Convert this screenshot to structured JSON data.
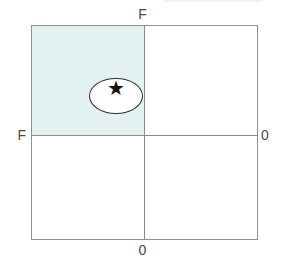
{
  "figure": {
    "axis_labels": {
      "top": "F",
      "left": "F",
      "right": "0",
      "bottom": "0"
    },
    "star_glyph": "★",
    "colors": {
      "shaded_quadrant": "#e3f2f1",
      "square_border": "#919191",
      "axis_line": "#8c8c8c",
      "ellipse_outline": "#2f2f2f",
      "star": "#111111",
      "label_text": "#4a4a4a",
      "background": "#ffffff"
    }
  }
}
